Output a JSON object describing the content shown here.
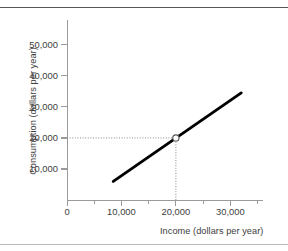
{
  "figure": {
    "name": "consumption-function-graph",
    "top_rule_color": "#555555",
    "bottom_rule_color": "#b9b9b9"
  },
  "chart_data": {
    "type": "line",
    "title": "",
    "xlabel": "Income (dollars per year)",
    "ylabel": "Consumption (dollars per year)",
    "xlim": [
      0,
      36000
    ],
    "ylim": [
      0,
      58000
    ],
    "grid": false,
    "legend": "none",
    "line_color": "#000000",
    "series": [
      {
        "name": "Consumption function",
        "x": [
          8500,
          32000
        ],
        "y": [
          6000,
          34500
        ]
      }
    ],
    "marker_points": [
      {
        "name": "break-even-point",
        "x": 20000,
        "y": 20000,
        "style": "open-circle",
        "fill": "#ffffff",
        "stroke": "#555555"
      }
    ],
    "guide_lines": [
      {
        "name": "horizontal-guide-20000",
        "orientation": "horizontal",
        "value": 20000,
        "from": 0,
        "to": 20000,
        "style": "dotted",
        "color": "#8a8a8a"
      },
      {
        "name": "vertical-guide-20000",
        "orientation": "vertical",
        "value": 20000,
        "from": 0,
        "to": 20000,
        "style": "dotted",
        "color": "#8a8a8a"
      }
    ],
    "x_ticks": [
      {
        "value": 0,
        "label": "0",
        "major": true
      },
      {
        "value": 5000,
        "label": "",
        "major": false
      },
      {
        "value": 10000,
        "label": "10,000",
        "major": true
      },
      {
        "value": 15000,
        "label": "",
        "major": false
      },
      {
        "value": 20000,
        "label": "20,000",
        "major": true
      },
      {
        "value": 25000,
        "label": "",
        "major": false
      },
      {
        "value": 30000,
        "label": "30,000",
        "major": true
      },
      {
        "value": 35000,
        "label": "",
        "major": false
      }
    ],
    "y_ticks": [
      {
        "value": 10000,
        "label": "10,000"
      },
      {
        "value": 20000,
        "label": "20,000"
      },
      {
        "value": 30000,
        "label": "30,000"
      },
      {
        "value": 40000,
        "label": "40,000"
      },
      {
        "value": 50000,
        "label": "50,000"
      }
    ]
  }
}
